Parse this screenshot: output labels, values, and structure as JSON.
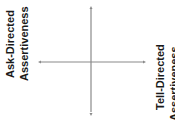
{
  "diagram": {
    "left_label": {
      "line1": "Ask-Directed",
      "line2": "Assertiveness"
    },
    "right_label": {
      "line1": "Tell-Directed",
      "line2": "Assertiveness"
    },
    "axes": {
      "horizontal": "bidirectional arrow",
      "vertical": "bidirectional arrow",
      "line_color": "#8a8a8a"
    }
  }
}
